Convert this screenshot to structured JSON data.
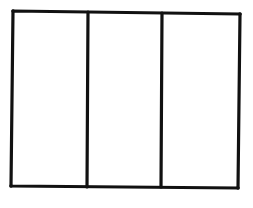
{
  "diagram": {
    "stroke_color": "#111111",
    "background_color": "#ffffff",
    "outer_rectangle": {
      "top_left": [
        13,
        11
      ],
      "top_right": [
        240,
        14
      ],
      "bottom_right": [
        238,
        188
      ],
      "bottom_left": [
        11,
        186
      ]
    },
    "dividers": [
      {
        "top": [
          88,
          12
        ],
        "bottom": [
          87,
          187
        ]
      },
      {
        "top": [
          162,
          13
        ],
        "bottom": [
          161,
          187
        ]
      }
    ],
    "column_count": 3
  }
}
